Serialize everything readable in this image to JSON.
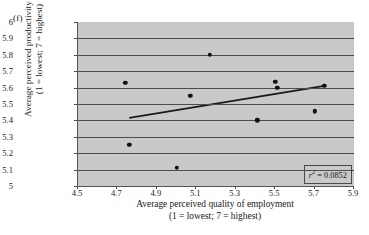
{
  "figure": {
    "panel_label": "(f)",
    "background_color": "#c9c9c9",
    "grid_color": "#4d4d4d",
    "point_color": "#111111",
    "line_color": "#1a1a1a"
  },
  "axis_titles": {
    "x_line1": "Average perceived quality of employment",
    "x_line2": "(1 = lowest; 7 = highest)",
    "y_line1": "Average perceived productivity level",
    "y_line2": "(1 = lowest; 7 = highest)"
  },
  "annotation": {
    "r_symbol": "r",
    "r_exponent": "2",
    "r_equals": " = 0.0852",
    "full_text": "r2 = 0.0852"
  },
  "x_ticks": [
    "4.5",
    "4.7",
    "4.9",
    "5.1",
    "5.3",
    "5.5",
    "5.7",
    "5.9"
  ],
  "y_ticks": [
    "5",
    "5.1",
    "5.2",
    "5.3",
    "5.4",
    "5.5",
    "5.6",
    "5.7",
    "5.8",
    "5.9",
    "6"
  ],
  "chart_data": {
    "type": "scatter",
    "title": "",
    "xlabel": "Average perceived quality of employment (1 = lowest; 7 = highest)",
    "ylabel": "Average perceived productivity level (1 = lowest; 7 = highest)",
    "xlim": [
      4.5,
      5.9
    ],
    "ylim": [
      5.0,
      6.0
    ],
    "xticks": [
      4.5,
      4.7,
      4.9,
      5.1,
      5.3,
      5.5,
      5.7,
      5.9
    ],
    "yticks": [
      5.0,
      5.1,
      5.2,
      5.3,
      5.4,
      5.5,
      5.6,
      5.7,
      5.8,
      5.9,
      6.0
    ],
    "grid": "horizontal",
    "legend": "none",
    "r_squared": 0.0852,
    "points": [
      {
        "x": 4.74,
        "y": 5.63
      },
      {
        "x": 4.76,
        "y": 5.25
      },
      {
        "x": 5.0,
        "y": 5.11
      },
      {
        "x": 5.07,
        "y": 5.55
      },
      {
        "x": 5.17,
        "y": 5.8
      },
      {
        "x": 5.41,
        "y": 5.4
      },
      {
        "x": 5.5,
        "y": 5.635
      },
      {
        "x": 5.51,
        "y": 5.6
      },
      {
        "x": 5.7,
        "y": 5.455
      },
      {
        "x": 5.75,
        "y": 5.61
      }
    ],
    "trendline": {
      "x0": 4.76,
      "y0": 5.415,
      "x1": 5.75,
      "y1": 5.61
    }
  }
}
